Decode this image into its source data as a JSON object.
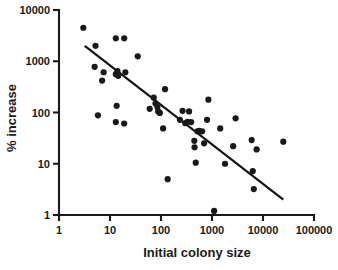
{
  "chart_data": {
    "type": "scatter",
    "title": "",
    "xlabel": "Initial colony size",
    "ylabel": "% increase",
    "xscale": "log",
    "yscale": "log",
    "xlim": [
      1,
      100000
    ],
    "ylim": [
      1,
      10000
    ],
    "grid": false,
    "legend": null,
    "xticks": [
      1,
      10,
      100,
      1000,
      10000,
      100000
    ],
    "xticklabels": [
      "1",
      "10",
      "100",
      "1000",
      "10000",
      "100000"
    ],
    "yticks": [
      1,
      10,
      100,
      1000,
      10000
    ],
    "yticklabels": [
      "1",
      "10",
      "100",
      "1000",
      "10000"
    ],
    "marker": "filled-circle",
    "marker_color": "#191919",
    "points": [
      {
        "x": 3.0,
        "y": 4500
      },
      {
        "x": 5.2,
        "y": 2000
      },
      {
        "x": 13.0,
        "y": 2800
      },
      {
        "x": 19.0,
        "y": 2800
      },
      {
        "x": 35.0,
        "y": 1250
      },
      {
        "x": 5.0,
        "y": 780
      },
      {
        "x": 7.5,
        "y": 610
      },
      {
        "x": 7.0,
        "y": 420
      },
      {
        "x": 13.0,
        "y": 560
      },
      {
        "x": 14.0,
        "y": 640
      },
      {
        "x": 14.5,
        "y": 520
      },
      {
        "x": 20.0,
        "y": 610
      },
      {
        "x": 5.8,
        "y": 88
      },
      {
        "x": 13.5,
        "y": 135
      },
      {
        "x": 13.0,
        "y": 65
      },
      {
        "x": 19.0,
        "y": 61
      },
      {
        "x": 60.0,
        "y": 118
      },
      {
        "x": 72.0,
        "y": 195
      },
      {
        "x": 78.0,
        "y": 150
      },
      {
        "x": 85.0,
        "y": 128
      },
      {
        "x": 88.0,
        "y": 105
      },
      {
        "x": 95.0,
        "y": 98
      },
      {
        "x": 120.0,
        "y": 285
      },
      {
        "x": 110.0,
        "y": 49
      },
      {
        "x": 135.0,
        "y": 5.0
      },
      {
        "x": 235.0,
        "y": 72
      },
      {
        "x": 265.0,
        "y": 108
      },
      {
        "x": 300.0,
        "y": 62
      },
      {
        "x": 330.0,
        "y": 66
      },
      {
        "x": 355.0,
        "y": 105
      },
      {
        "x": 390.0,
        "y": 65
      },
      {
        "x": 450.0,
        "y": 28
      },
      {
        "x": 455.0,
        "y": 21
      },
      {
        "x": 480.0,
        "y": 10.5
      },
      {
        "x": 520.0,
        "y": 43
      },
      {
        "x": 560.0,
        "y": 44
      },
      {
        "x": 640.0,
        "y": 43
      },
      {
        "x": 700.0,
        "y": 25
      },
      {
        "x": 800.0,
        "y": 72
      },
      {
        "x": 850.0,
        "y": 178
      },
      {
        "x": 1100.0,
        "y": 1.2
      },
      {
        "x": 1450.0,
        "y": 49
      },
      {
        "x": 1800.0,
        "y": 10
      },
      {
        "x": 2600.0,
        "y": 22
      },
      {
        "x": 2900.0,
        "y": 77
      },
      {
        "x": 6000.0,
        "y": 29
      },
      {
        "x": 6300.0,
        "y": 7.2
      },
      {
        "x": 6600.0,
        "y": 3.2
      },
      {
        "x": 7500.0,
        "y": 19
      },
      {
        "x": 25000.0,
        "y": 27
      }
    ],
    "fit_line": {
      "type": "linear-regression-on-log-log",
      "start": {
        "x": 3.2,
        "y": 2000
      },
      "end": {
        "x": 25000.0,
        "y": 2.0
      }
    }
  }
}
